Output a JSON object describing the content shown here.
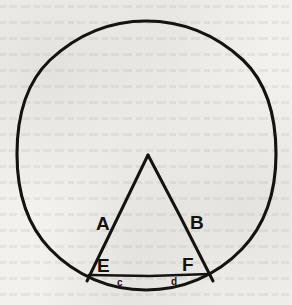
{
  "figure": {
    "background_color": "#f2f1ee",
    "ink_color": "#15120f",
    "canvas": {
      "width": 292,
      "height": 305
    },
    "circle": {
      "name": "circumscribing-circle",
      "center_x": 146,
      "center_y": 155,
      "radius_x": 129,
      "radius_y": 134,
      "stroke_width": 3.1
    },
    "triangle": {
      "name": "inscribed-triangle",
      "apex": {
        "x": 148,
        "y": 155
      },
      "left_foot": {
        "x": 87,
        "y": 281
      },
      "right_foot": {
        "x": 213,
        "y": 281
      },
      "stroke_width": 3.0
    },
    "chord": {
      "name": "base-chord-EF",
      "x1": 89,
      "y1": 275,
      "x2": 210,
      "y2": 274,
      "stroke_width": 2.6
    },
    "labels": [
      {
        "id": "A",
        "text": "A",
        "x": 96,
        "y": 230,
        "role": "left-side-label"
      },
      {
        "id": "B",
        "text": "B",
        "x": 190,
        "y": 229,
        "role": "right-side-label"
      },
      {
        "id": "E",
        "text": "E",
        "x": 97,
        "y": 272,
        "role": "left-base-vertex-label"
      },
      {
        "id": "F",
        "text": "F",
        "x": 182,
        "y": 271,
        "role": "right-base-vertex-label"
      },
      {
        "id": "c",
        "text": "c",
        "x": 117,
        "y": 286,
        "role": "left-arc-segment-label"
      },
      {
        "id": "d",
        "text": "d",
        "x": 171,
        "y": 285,
        "role": "right-arc-segment-label"
      }
    ]
  }
}
